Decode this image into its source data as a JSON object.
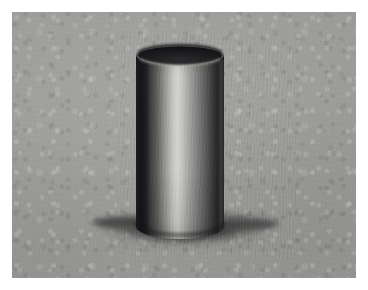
{
  "artwork": {
    "title": "Cylinder Value Study",
    "medium": "graphite on toned gray paper",
    "subject": "open cylinder (tube) with cast shadow",
    "caption": ""
  },
  "canvas": {
    "width": 368,
    "height": 290,
    "margin_color": "#ffffff",
    "margin_px": 12
  },
  "paper": {
    "x": 12,
    "y": 12,
    "width": 344,
    "height": 266,
    "base_color": "#9b9b99",
    "texture": "mottled laid paper grain"
  },
  "cylinder": {
    "left": 136,
    "right": 224,
    "width": 88,
    "top_center_y": 55,
    "bottom_y": 238,
    "ellipse_rx": 44,
    "ellipse_ry": 9.5,
    "opening_color": "#17171a",
    "rim_highlight_color": "#b9b9b6",
    "body_gradient": [
      {
        "stop": 0,
        "color": "#2a2a2c"
      },
      {
        "stop": 0.06,
        "color": "#1e1e20"
      },
      {
        "stop": 0.16,
        "color": "#38383a"
      },
      {
        "stop": 0.28,
        "color": "#6e6e6d"
      },
      {
        "stop": 0.4,
        "color": "#b2b2ae"
      },
      {
        "stop": 0.47,
        "color": "#cfcfca"
      },
      {
        "stop": 0.54,
        "color": "#b8b8b4"
      },
      {
        "stop": 0.66,
        "color": "#868684"
      },
      {
        "stop": 0.78,
        "color": "#5a5a5a"
      },
      {
        "stop": 0.88,
        "color": "#333335"
      },
      {
        "stop": 0.96,
        "color": "#1b1b1d"
      },
      {
        "stop": 1,
        "color": "#262628"
      }
    ]
  },
  "cast_shadow": {
    "center_x": 186,
    "center_y": 229,
    "rx": 92,
    "ry": 17,
    "left_extent": 95,
    "right_extent": 278,
    "core_color": "#2e2e2e",
    "edge_color": "#6f6f6d",
    "direction": "left and right of base, light from front-upper-left"
  },
  "light": {
    "source": "upper left / front",
    "highlight_position_pct": 47,
    "reflected_light_right_edge": true
  }
}
